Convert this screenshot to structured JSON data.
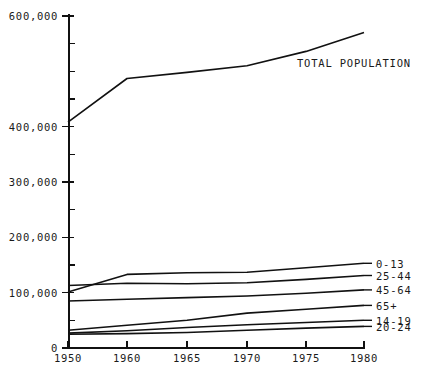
{
  "chart_data": {
    "type": "line",
    "title": "",
    "xlabel": "",
    "ylabel": "",
    "x": [
      1950,
      1960,
      1965,
      1970,
      1975,
      1980
    ],
    "xlim": [
      1950,
      1980
    ],
    "ylim": [
      0,
      600000
    ],
    "grid": false,
    "legend_position": "inline-right",
    "y_ticks_major": [
      0,
      100000,
      200000,
      300000,
      400000,
      600000
    ],
    "y_tick_labels": [
      "0",
      "100,000",
      "200,000",
      "300,000",
      "400,000",
      "600,000"
    ],
    "y_tick_minor_step": 50000,
    "x_tick_labels": [
      "1950",
      "1960",
      "1965",
      "1970",
      "1975",
      "1980"
    ],
    "series": [
      {
        "name": "TOTAL POPULATION",
        "label": "TOTAL POPULATION",
        "values": [
          408000,
          487000,
          498000,
          510000,
          536000,
          570000
        ]
      },
      {
        "name": "0-13",
        "label": "0-13",
        "values": [
          101000,
          133000,
          136000,
          137000,
          145000,
          153000
        ]
      },
      {
        "name": "25-44",
        "label": "25-44",
        "values": [
          113000,
          117000,
          116000,
          118000,
          124000,
          131000
        ]
      },
      {
        "name": "45-64",
        "label": "45-64",
        "values": [
          85000,
          88000,
          91000,
          94000,
          99000,
          105000
        ]
      },
      {
        "name": "65+",
        "label": "65+",
        "values": [
          32000,
          41000,
          50000,
          63000,
          70000,
          77000
        ]
      },
      {
        "name": "14-19",
        "label": "14-19",
        "values": [
          27000,
          31000,
          37000,
          42000,
          46000,
          50000
        ]
      },
      {
        "name": "20-24",
        "label": "20-24",
        "values": [
          25000,
          26000,
          28000,
          32000,
          36000,
          39000
        ]
      }
    ]
  },
  "labels": {
    "total_population": "TOTAL POPULATION",
    "age_0_13": "0-13",
    "age_25_44": "25-44",
    "age_45_64": "45-64",
    "age_65_plus": "65+",
    "age_14_19": "14-19",
    "age_20_24": "20-24"
  },
  "colors": {
    "line": "#111111",
    "axis": "#111111",
    "background": "#ffffff",
    "text": "#1a1a1a"
  }
}
